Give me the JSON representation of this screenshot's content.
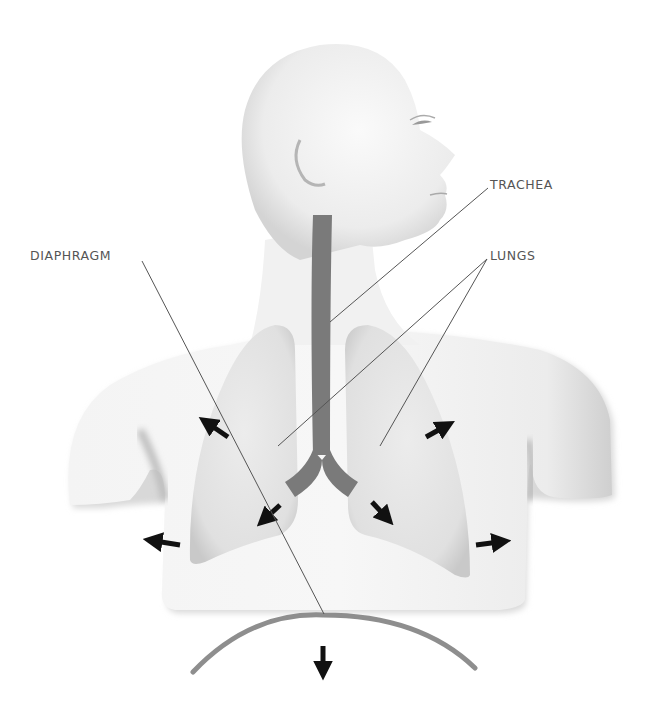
{
  "diagram": {
    "labels": {
      "trachea": "TRACHEA",
      "lungs": "LUNGS",
      "diaphragm": "DIAPHRAGM"
    },
    "arrows": [
      {
        "id": "upper-left",
        "direction": "up-left"
      },
      {
        "id": "upper-right",
        "direction": "up-right"
      },
      {
        "id": "left-bronchus",
        "direction": "down-left"
      },
      {
        "id": "right-bronchus",
        "direction": "down-right"
      },
      {
        "id": "left-side",
        "direction": "left"
      },
      {
        "id": "right-side",
        "direction": "right"
      },
      {
        "id": "bottom",
        "direction": "down"
      }
    ],
    "colors": {
      "background": "#ffffff",
      "body": "#f2f2f2",
      "body_shadow": "#cfcfcf",
      "lung": "#e3e3e3",
      "lung_edge": "#c8c8c8",
      "airway": "#7a7a7a",
      "diaphragm": "#8e8e8e",
      "arrow": "#111111",
      "leader_line": "#555555",
      "label_text": "#555555"
    }
  }
}
